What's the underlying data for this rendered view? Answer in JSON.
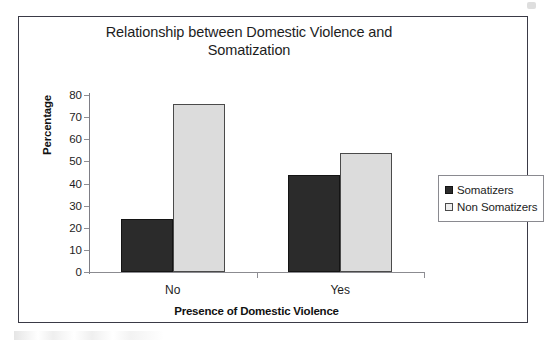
{
  "chart_data": {
    "type": "bar",
    "title": "Relationship between Domestic Violence and Somatization",
    "title_lines": [
      "Relationship between Domestic Violence and",
      "Somatization"
    ],
    "xlabel": "Presence of Domestic Violence",
    "ylabel": "Percentage",
    "categories": [
      "No",
      "Yes"
    ],
    "series": [
      {
        "name": "Somatizers",
        "values": [
          24,
          44
        ],
        "color": "#2b2b2b"
      },
      {
        "name": "Non Somatizers",
        "values": [
          76,
          54
        ],
        "color": "#dcdcdc"
      }
    ],
    "ylim": [
      0,
      80
    ],
    "ytick_values": [
      80,
      70,
      60,
      50,
      40,
      30,
      20,
      10,
      0
    ],
    "ytick_labels": [
      "80",
      "70",
      "60",
      "50",
      "40",
      "30",
      "20",
      "10",
      "0"
    ],
    "grid": false,
    "legend_position": "right",
    "legend_entries": [
      "Somatizers",
      "Non Somatizers"
    ]
  },
  "colors": {
    "series_dark": "#2b2b2b",
    "series_light": "#dcdcdc",
    "frame_border": "#3a3a46",
    "axis": "#8b8b90",
    "text": "#1d1d1d"
  }
}
